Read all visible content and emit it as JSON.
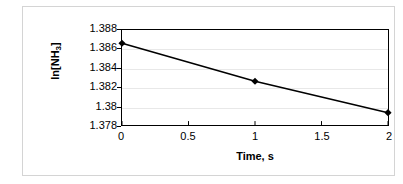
{
  "chart_data": {
    "type": "line",
    "title": "",
    "xlabel": "Time, s",
    "ylabel": "ln[NH3]",
    "ylabel_base": "ln[NH",
    "ylabel_sub": "3",
    "ylabel_tail": "]",
    "x": [
      0,
      1,
      2
    ],
    "values": [
      1.3866,
      1.3826,
      1.3793
    ],
    "series": [
      {
        "name": "ln[NH3]",
        "values": [
          1.3866,
          1.3826,
          1.3793
        ]
      }
    ],
    "xlim": [
      0,
      2
    ],
    "ylim": [
      1.378,
      1.388
    ],
    "x_ticks": [
      0,
      0.5,
      1,
      1.5,
      2
    ],
    "x_tick_labels": [
      "0",
      "0.5",
      "1",
      "1.5",
      "2"
    ],
    "y_ticks": [
      1.378,
      1.38,
      1.382,
      1.384,
      1.386,
      1.388
    ],
    "y_tick_labels": [
      "1.378",
      "1.38",
      "1.382",
      "1.384",
      "1.386",
      "1.388"
    ],
    "grid": true,
    "grid_axis": "y",
    "legend": false,
    "legend_position": "none",
    "marker": "diamond",
    "line_color": "#000000",
    "marker_color": "#000000",
    "grid_color": "#e8e8e8",
    "plot_border_color": "#000000",
    "chart_border_color": "#d4d4d4",
    "background_color": "#ffffff"
  }
}
